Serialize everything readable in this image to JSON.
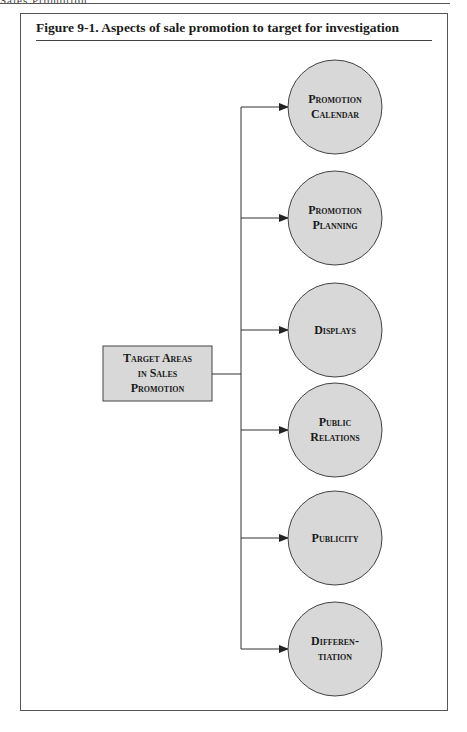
{
  "page": {
    "running_head": "Sales Promotion"
  },
  "figure": {
    "title": "Figure 9-1.  Aspects of sale promotion to target for investigation",
    "source_node": {
      "line1": "Target Areas",
      "line2": "in Sales",
      "line3": "Promotion"
    },
    "targets": [
      {
        "line1": "Promotion",
        "line2": "Calendar"
      },
      {
        "line1": "Promotion",
        "line2": "Planning"
      },
      {
        "line1": "Displays",
        "line2": ""
      },
      {
        "line1": "Public",
        "line2": "Relations"
      },
      {
        "line1": "Publicity",
        "line2": ""
      },
      {
        "line1": "Differen-",
        "line2": "tiation"
      }
    ],
    "colors": {
      "node_fill": "#d8d8d8",
      "node_stroke": "#444444",
      "line": "#333333"
    }
  }
}
